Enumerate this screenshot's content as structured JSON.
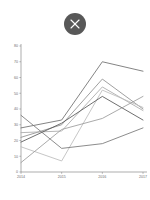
{
  "close_button": {
    "icon": "close-x-icon",
    "label": "Close",
    "circle_color": "#585858",
    "glyph_color": "#ffffff"
  },
  "chart_data": {
    "type": "line",
    "title": "",
    "subtitle": "",
    "xlabel": "",
    "ylabel": "",
    "categories": [
      "2014",
      "2015",
      "2016",
      "2017"
    ],
    "x": [
      2014,
      2015,
      2016,
      2017
    ],
    "xlim": [
      2014,
      2017
    ],
    "ylim": [
      0,
      80
    ],
    "yticks": [
      0,
      10,
      20,
      30,
      40,
      50,
      60,
      70,
      80
    ],
    "ytick_labels": [
      "0",
      "10",
      "20",
      "30",
      "40",
      "50",
      "60",
      "70",
      "80"
    ],
    "xticks": [
      2014,
      2015,
      2016,
      2017
    ],
    "xtick_labels": [
      "2014",
      "2015",
      "2016",
      "2017"
    ],
    "grid": false,
    "legend": false,
    "legend_position": "none",
    "annotations": [],
    "series": [
      {
        "name": "Series 1",
        "color": "#6e6e6e",
        "values": [
          28,
          33,
          70,
          64
        ]
      },
      {
        "name": "Series 2",
        "color": "#8f8f8f",
        "values": [
          22,
          30,
          59,
          40
        ]
      },
      {
        "name": "Series 3",
        "color": "#a9a9a9",
        "values": [
          25,
          26,
          54,
          39
        ]
      },
      {
        "name": "Series 4",
        "color": "#bcbcbc",
        "values": [
          16,
          7,
          52,
          41
        ]
      },
      {
        "name": "Series 5",
        "color": "#555555",
        "values": [
          19,
          31,
          48,
          33
        ]
      },
      {
        "name": "Series 6",
        "color": "#9b9b9b",
        "values": [
          6,
          27,
          34,
          48
        ]
      },
      {
        "name": "Series 7",
        "color": "#777777",
        "values": [
          36,
          15,
          18,
          28
        ]
      }
    ]
  }
}
